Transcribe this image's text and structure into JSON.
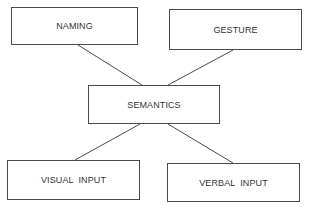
{
  "diagram": {
    "nodes": [
      {
        "id": "naming",
        "label": "NAMING"
      },
      {
        "id": "gesture",
        "label": "GESTURE"
      },
      {
        "id": "semantics",
        "label": "SEMANTICS"
      },
      {
        "id": "visual_input",
        "label": "VISUAL  INPUT"
      },
      {
        "id": "verbal_input",
        "label": "VERBAL  INPUT"
      }
    ],
    "edges": [
      {
        "from": "naming",
        "to": "semantics"
      },
      {
        "from": "gesture",
        "to": "semantics"
      },
      {
        "from": "semantics",
        "to": "visual_input"
      },
      {
        "from": "semantics",
        "to": "verbal_input"
      }
    ],
    "colors": {
      "stroke": "#4a4a4a",
      "text": "#333333",
      "background": "#ffffff"
    }
  }
}
